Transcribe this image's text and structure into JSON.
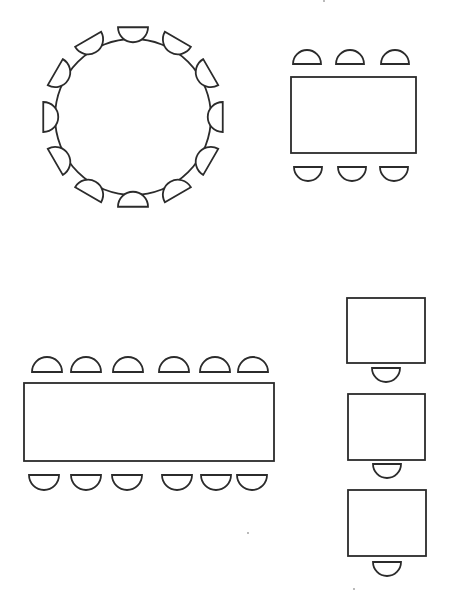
{
  "diagram": {
    "type": "seating-layout",
    "stroke_color": "#2b2b2b",
    "background": "#ffffff",
    "groups": [
      {
        "id": "round-table-group",
        "table": {
          "shape": "circle",
          "cx": 133,
          "cy": 117,
          "r": 78
        },
        "chairs": {
          "count": 12,
          "orbit_radius": 95,
          "chair_radius": 15,
          "start_angle_deg": -90,
          "step_deg": 30
        }
      },
      {
        "id": "rect-table-6-group",
        "table": {
          "shape": "rect",
          "x": 291,
          "y": 77,
          "w": 125,
          "h": 76
        },
        "chairs_top": {
          "centers_x": [
            307,
            350,
            395
          ],
          "flat_y": 64,
          "r": 14,
          "facing": "down"
        },
        "chairs_bottom": {
          "centers_x": [
            308,
            352,
            394
          ],
          "flat_y": 167,
          "r": 14,
          "facing": "up"
        }
      },
      {
        "id": "long-table-12-group",
        "table": {
          "shape": "rect",
          "x": 24,
          "y": 383,
          "w": 250,
          "h": 78
        },
        "chairs_top": {
          "centers_x": [
            47,
            86,
            128,
            174,
            215,
            253
          ],
          "flat_y": 372,
          "r": 15,
          "facing": "down"
        },
        "chairs_bottom": {
          "centers_x": [
            44,
            86,
            127,
            177,
            216,
            252
          ],
          "flat_y": 475,
          "r": 15,
          "facing": "up"
        }
      },
      {
        "id": "single-desks-group",
        "desks": [
          {
            "x": 347,
            "y": 298,
            "w": 78,
            "h": 65,
            "chair_cx": 386,
            "chair_flat_y": 368
          },
          {
            "x": 348,
            "y": 394,
            "w": 77,
            "h": 66,
            "chair_cx": 387,
            "chair_flat_y": 464
          },
          {
            "x": 348,
            "y": 490,
            "w": 78,
            "h": 66,
            "chair_cx": 387,
            "chair_flat_y": 562
          }
        ],
        "chair_r": 14
      }
    ],
    "specks": [
      {
        "x": 248,
        "y": 533
      },
      {
        "x": 354,
        "y": 589
      },
      {
        "x": 324,
        "y": 1
      }
    ]
  }
}
